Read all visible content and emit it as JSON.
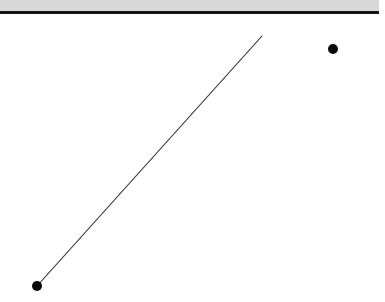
{
  "app": {
    "title": "Line Segment Canvas",
    "width": 385,
    "height": 302,
    "background_color": "#ffffff"
  },
  "toolbar": {
    "name": "top-toolbar",
    "fill_color": "#d9d9d9",
    "rule_color": "#141414",
    "x": 0,
    "y": 0,
    "width": 379,
    "strip_height": 11,
    "rule_y": 11,
    "rule_height": 3
  },
  "canvas": {
    "name": "drawing-canvas",
    "background_color": "#ffffff",
    "x": 0,
    "y": 14,
    "width": 385,
    "height": 288
  },
  "shapes": {
    "line": {
      "name": "diagonal-line-segment",
      "stroke_color": "#2b2b2b",
      "stroke_width": 1.1,
      "x1": 37,
      "y1": 286,
      "x2": 262,
      "y2": 36
    },
    "points": [
      {
        "name": "anchor-point-lower-left",
        "cx": 37,
        "cy": 286,
        "r": 5,
        "fill_color": "#0a0a0a"
      },
      {
        "name": "isolated-point-upper-right",
        "cx": 333,
        "cy": 49,
        "r": 5,
        "fill_color": "#0a0a0a"
      }
    ]
  }
}
